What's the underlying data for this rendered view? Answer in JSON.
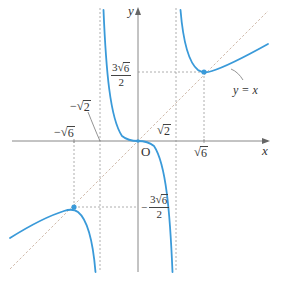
{
  "diagram": {
    "type": "function-graph",
    "function": "y = x^3 / (x^2 - 2)",
    "colors": {
      "curve": "#3a9ad9",
      "axis": "#888888",
      "guide": "#999999",
      "asymptote_diag": "#c8a890",
      "text": "#333333"
    },
    "axes": {
      "x_label": "x",
      "y_label": "y",
      "origin_label": "O"
    },
    "asymptotes": {
      "vertical": [
        "-√2",
        "√2"
      ],
      "oblique": "y = x"
    },
    "labels": {
      "neg_sqrt2": {
        "sign": "−",
        "radicand": "2"
      },
      "neg_sqrt6": {
        "sign": "−",
        "radicand": "6"
      },
      "pos_sqrt2": {
        "radicand": "2"
      },
      "pos_sqrt6": {
        "radicand": "6"
      },
      "y_max_value": {
        "coef": "3",
        "radicand": "6",
        "den": "2"
      },
      "y_min_value": {
        "sign": "−",
        "coef": "3",
        "radicand": "6",
        "den": "2"
      },
      "oblique_label": "y = x"
    },
    "extrema": [
      {
        "type": "local-min",
        "x": "√6",
        "y": "3√6/2"
      },
      {
        "type": "local-max",
        "x": "−√6",
        "y": "−3√6/2"
      }
    ],
    "inflection": {
      "x": "0",
      "y": "0"
    }
  }
}
